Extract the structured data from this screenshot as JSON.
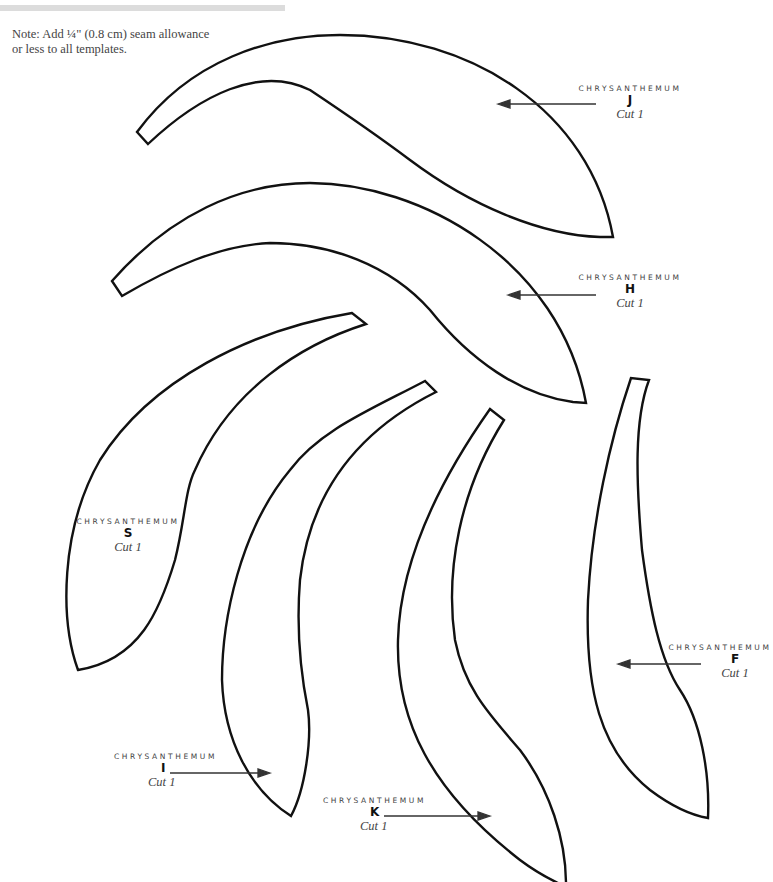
{
  "note": {
    "line1": "Note: Add ¼\" (0.8 cm) seam allowance",
    "line2": "or less to all templates."
  },
  "templates": [
    {
      "id": "J",
      "name": "CHRYSANTHEMUM",
      "letter": "J",
      "cut": "Cut 1"
    },
    {
      "id": "H",
      "name": "CHRYSANTHEMUM",
      "letter": "H",
      "cut": "Cut 1"
    },
    {
      "id": "S",
      "name": "CHRYSANTHEMUM",
      "letter": "S",
      "cut": "Cut 1"
    },
    {
      "id": "I",
      "name": "CHRYSANTHEMUM",
      "letter": "I",
      "cut": "Cut 1"
    },
    {
      "id": "K",
      "name": "CHRYSANTHEMUM",
      "letter": "K",
      "cut": "Cut 1"
    },
    {
      "id": "F",
      "name": "CHRYSANTHEMUM",
      "letter": "F",
      "cut": "Cut 1"
    }
  ],
  "colors": {
    "outline": "#111111",
    "text": "#444444",
    "top_bar": "#dcdcdc"
  }
}
